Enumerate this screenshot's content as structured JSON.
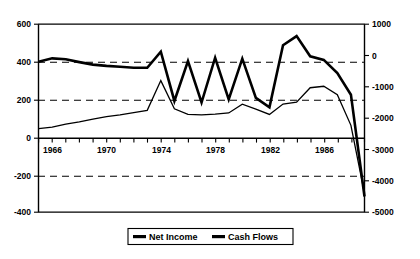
{
  "chart_data": {
    "type": "line",
    "title": "",
    "subtitle": "",
    "xlabel": "",
    "ylabel": "",
    "grid": "horizontal-dashed",
    "legend_position": "bottom-center",
    "x": [
      1965,
      1966,
      1967,
      1968,
      1969,
      1970,
      1971,
      1972,
      1973,
      1974,
      1975,
      1976,
      1977,
      1978,
      1979,
      1980,
      1981,
      1982,
      1983,
      1984,
      1985,
      1986,
      1987,
      1988,
      1989
    ],
    "x_tick_labels": [
      "1966",
      "1970",
      "1974",
      "1978",
      "1982",
      "1986"
    ],
    "x_tick_label_years": [
      1966,
      1970,
      1974,
      1978,
      1982,
      1986
    ],
    "x_minor_tick_years": [
      1965,
      1966,
      1967,
      1968,
      1969,
      1970,
      1971,
      1972,
      1973,
      1974,
      1975,
      1976,
      1977,
      1978,
      1979,
      1980,
      1981,
      1982,
      1983,
      1984,
      1985,
      1986,
      1987,
      1988,
      1989
    ],
    "left_axis": {
      "name": "Net Income",
      "ticks": [
        600,
        400,
        200,
        0,
        -200,
        -400
      ],
      "tick_labels": [
        "600",
        "400",
        "200",
        "0",
        "-200",
        "-400"
      ],
      "ylim": [
        -400,
        600
      ],
      "dashed_gridlines": [
        400,
        200,
        -200
      ]
    },
    "right_axis": {
      "name": "Cash Flows",
      "ticks": [
        1000,
        0,
        -1000,
        -2000,
        -3000,
        -4000,
        -5000
      ],
      "tick_labels": [
        "1000",
        "0",
        "-1000",
        "-2000",
        "-3000",
        "-4000",
        "-5000"
      ],
      "ylim": [
        -5000,
        1000
      ]
    },
    "series": [
      {
        "name": "Net Income",
        "axis": "left",
        "line_width": "thin",
        "values": [
          45,
          52,
          68,
          80,
          95,
          108,
          118,
          130,
          142,
          300,
          150,
          120,
          118,
          122,
          128,
          175,
          148,
          120,
          175,
          185,
          262,
          270,
          225,
          62,
          -300
        ]
      },
      {
        "name": "Cash Flows",
        "axis": "right",
        "line_width": "thick",
        "values": [
          -195,
          -90,
          -120,
          -210,
          -290,
          -330,
          -360,
          -390,
          -390,
          120,
          -1450,
          -180,
          -1500,
          -70,
          -1400,
          -100,
          -1350,
          -1650,
          330,
          620,
          -25,
          -140,
          -560,
          -1250,
          -4500
        ]
      }
    ],
    "legend": [
      {
        "label": "Net Income",
        "marker": "thick-line"
      },
      {
        "label": "Cash Flows",
        "marker": "thick-line"
      }
    ]
  },
  "labels": {
    "y_left": {
      "t600": "600",
      "t400": "400",
      "t200": "200",
      "t0": "0",
      "tm200": "-200",
      "tm400": "-400"
    },
    "y_right": {
      "t1000": "1000",
      "t0": "0",
      "tm1000": "-1000",
      "tm2000": "-2000",
      "tm3000": "-3000",
      "tm4000": "-4000",
      "tm5000": "-5000"
    },
    "x_axis": {
      "y1966": "1966",
      "y1970": "1970",
      "y1974": "1974",
      "y1978": "1978",
      "y1982": "1982",
      "y1986": "1986"
    },
    "legend": {
      "net_income": "Net Income",
      "cash_flows": "Cash Flows"
    }
  }
}
